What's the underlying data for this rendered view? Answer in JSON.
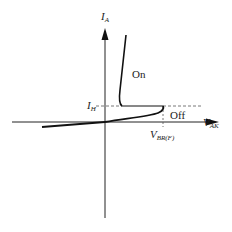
{
  "diagram": {
    "axes": {
      "y_label": "I",
      "y_sub": "A",
      "x_label": "V",
      "x_sub": "AK"
    },
    "annotations": {
      "holding_current": "I",
      "holding_sub": "H",
      "breakover_voltage": "V",
      "breakover_sub": "BR(F)",
      "on_region": "On",
      "off_region": "Off"
    },
    "colors": {
      "line": "#1a1a1a",
      "dashed": "#666666"
    }
  }
}
